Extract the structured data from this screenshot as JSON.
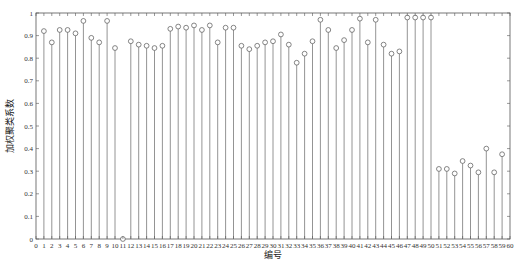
{
  "chart_data": {
    "type": "stem",
    "title": "",
    "xlabel": "编号",
    "ylabel": "加权聚类系数",
    "xlim": [
      0,
      60
    ],
    "ylim": [
      0,
      1
    ],
    "grid": false,
    "legend": null,
    "xticks": [
      0,
      1,
      2,
      3,
      4,
      5,
      6,
      7,
      8,
      9,
      10,
      11,
      12,
      13,
      14,
      15,
      16,
      17,
      18,
      19,
      20,
      21,
      22,
      23,
      24,
      25,
      26,
      27,
      28,
      29,
      30,
      31,
      32,
      33,
      34,
      35,
      36,
      37,
      38,
      39,
      40,
      41,
      42,
      43,
      44,
      45,
      46,
      47,
      48,
      49,
      50,
      51,
      52,
      53,
      54,
      55,
      56,
      57,
      58,
      59,
      60
    ],
    "yticks": [
      "0",
      "0.1",
      "0.2",
      "0.3",
      "0.4",
      "0.5",
      "0.6",
      "0.7",
      "0.8",
      "0.9",
      "1"
    ],
    "x": [
      1,
      2,
      3,
      4,
      5,
      6,
      7,
      8,
      9,
      10,
      11,
      12,
      13,
      14,
      15,
      16,
      17,
      18,
      19,
      20,
      21,
      22,
      23,
      24,
      25,
      26,
      27,
      28,
      29,
      30,
      31,
      32,
      33,
      34,
      35,
      36,
      37,
      38,
      39,
      40,
      41,
      42,
      43,
      44,
      45,
      46,
      47,
      48,
      49,
      50,
      51,
      52,
      53,
      54,
      55,
      56,
      57,
      58,
      59
    ],
    "values": [
      0.92,
      0.87,
      0.925,
      0.925,
      0.91,
      0.965,
      0.89,
      0.87,
      0.965,
      0.845,
      0.0,
      0.875,
      0.86,
      0.855,
      0.845,
      0.855,
      0.93,
      0.94,
      0.935,
      0.945,
      0.925,
      0.945,
      0.87,
      0.935,
      0.935,
      0.855,
      0.84,
      0.855,
      0.87,
      0.875,
      0.905,
      0.86,
      0.78,
      0.82,
      0.875,
      0.97,
      0.925,
      0.845,
      0.88,
      0.925,
      0.975,
      0.87,
      0.97,
      0.86,
      0.82,
      0.83,
      0.98,
      0.98,
      0.98,
      0.98,
      0.31,
      0.31,
      0.29,
      0.345,
      0.325,
      0.295,
      0.4,
      0.295,
      0.375
    ]
  },
  "colors": {
    "stem": "#888888",
    "marker": "#666666",
    "axis": "#555555"
  }
}
